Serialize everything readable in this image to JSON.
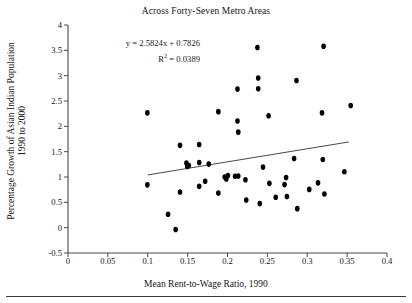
{
  "chart_data": {
    "type": "scatter",
    "title": "Across Forty-Seven Metro Areas",
    "xlabel": "Mean Rent-to-Wage Ratio, 1990",
    "ylabel_line1": "Percentage Growth of Asian Indian Population",
    "ylabel_line2": "1990 to 2000",
    "xlim": [
      0,
      0.4
    ],
    "ylim": [
      -0.5,
      4
    ],
    "xticks": [
      "0",
      "0.05",
      "0.1",
      "0.15",
      "0.2",
      "0.25",
      "0.3",
      "0.35",
      "0.4"
    ],
    "xtick_values": [
      0,
      0.05,
      0.1,
      0.15,
      0.2,
      0.25,
      0.3,
      0.35,
      0.4
    ],
    "yticks": [
      "4",
      "3.5",
      "3",
      "2.5",
      "2",
      "1.5",
      "1",
      "0.5",
      "0",
      "-0.5"
    ],
    "ytick_values": [
      4,
      3.5,
      3,
      2.5,
      2,
      1.5,
      1,
      0.5,
      0,
      -0.5
    ],
    "grid": false,
    "legend": false,
    "marker_color": "#000000",
    "annotations": {
      "equation": "y = 2.5824x + 0.7826",
      "r_squared_prefix": "R",
      "r_squared_sup": "2",
      "r_squared_value": " = 0.0389"
    },
    "trendline": {
      "slope": 2.5824,
      "intercept": 0.7826,
      "x_start": 0.1,
      "x_end": 0.352,
      "color": "#333333"
    },
    "points": [
      {
        "x": 0.0995,
        "y": 2.265
      },
      {
        "x": 0.0995,
        "y": 0.845
      },
      {
        "x": 0.1255,
        "y": 0.265
      },
      {
        "x": 0.135,
        "y": -0.035
      },
      {
        "x": 0.1405,
        "y": 1.625
      },
      {
        "x": 0.1405,
        "y": 0.705
      },
      {
        "x": 0.1485,
        "y": 1.275
      },
      {
        "x": 0.1495,
        "y": 1.205
      },
      {
        "x": 0.1515,
        "y": 1.225
      },
      {
        "x": 0.1645,
        "y": 1.64
      },
      {
        "x": 0.1645,
        "y": 1.285
      },
      {
        "x": 0.1645,
        "y": 0.815
      },
      {
        "x": 0.172,
        "y": 0.915
      },
      {
        "x": 0.1765,
        "y": 1.255
      },
      {
        "x": 0.1885,
        "y": 2.29
      },
      {
        "x": 0.1885,
        "y": 0.685
      },
      {
        "x": 0.1965,
        "y": 1.0
      },
      {
        "x": 0.1985,
        "y": 0.96
      },
      {
        "x": 0.2005,
        "y": 1.03
      },
      {
        "x": 0.2095,
        "y": 1.015
      },
      {
        "x": 0.2125,
        "y": 2.735
      },
      {
        "x": 0.2125,
        "y": 2.105
      },
      {
        "x": 0.2135,
        "y": 1.885
      },
      {
        "x": 0.2135,
        "y": 1.02
      },
      {
        "x": 0.2225,
        "y": 0.945
      },
      {
        "x": 0.2235,
        "y": 0.545
      },
      {
        "x": 0.2375,
        "y": 3.555
      },
      {
        "x": 0.2385,
        "y": 2.955
      },
      {
        "x": 0.2385,
        "y": 2.74
      },
      {
        "x": 0.2405,
        "y": 0.475
      },
      {
        "x": 0.2445,
        "y": 1.195
      },
      {
        "x": 0.2515,
        "y": 2.21
      },
      {
        "x": 0.2525,
        "y": 0.875
      },
      {
        "x": 0.2605,
        "y": 0.6
      },
      {
        "x": 0.2715,
        "y": 0.85
      },
      {
        "x": 0.2735,
        "y": 0.99
      },
      {
        "x": 0.2745,
        "y": 0.615
      },
      {
        "x": 0.2835,
        "y": 1.365
      },
      {
        "x": 0.2865,
        "y": 2.905
      },
      {
        "x": 0.2875,
        "y": 0.375
      },
      {
        "x": 0.3025,
        "y": 0.755
      },
      {
        "x": 0.3135,
        "y": 0.885
      },
      {
        "x": 0.3185,
        "y": 2.265
      },
      {
        "x": 0.3195,
        "y": 1.345
      },
      {
        "x": 0.3205,
        "y": 3.58
      },
      {
        "x": 0.3215,
        "y": 0.665
      },
      {
        "x": 0.3465,
        "y": 1.105
      },
      {
        "x": 0.3545,
        "y": 2.41
      }
    ]
  }
}
